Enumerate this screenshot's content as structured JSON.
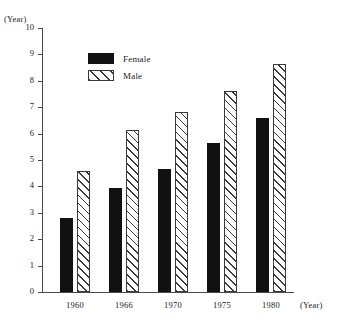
{
  "chart_data": {
    "type": "bar",
    "title": "",
    "subtitle": "",
    "xlabel": "(Year)",
    "ylabel": "(Year)",
    "categories": [
      "1960",
      "1966",
      "1970",
      "1975",
      "1980"
    ],
    "series": [
      {
        "name": "Female",
        "values": [
          2.8,
          3.95,
          4.65,
          5.65,
          6.6
        ],
        "color": "#111111",
        "fill": "solid"
      },
      {
        "name": "Male",
        "values": [
          4.6,
          6.15,
          6.8,
          7.6,
          8.65
        ],
        "color": "#3a3a3a",
        "fill": "diagonal-hatch"
      }
    ],
    "ylim": [
      0,
      10
    ],
    "ytick_values": [
      0,
      1,
      2,
      3,
      4,
      5,
      6,
      7,
      8,
      9,
      10
    ],
    "ytick_labels": [
      "0",
      "1",
      "2",
      "3",
      "4",
      "5",
      "6",
      "7",
      "8",
      "9",
      "10"
    ],
    "grid": false,
    "legend_position": "top-left-inside",
    "legend_entries": [
      "Female",
      "Male"
    ]
  },
  "axis": {
    "y_title": "(Year)",
    "x_title": "(Year)"
  },
  "legend": {
    "female_label": "Female",
    "male_label": "Male"
  }
}
